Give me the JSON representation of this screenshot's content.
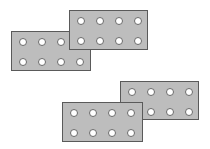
{
  "diagram": {
    "colors": {
      "background": "#ffffff",
      "brick_fill": "#bdbdbd",
      "brick_border": "#5a5a5a",
      "stud_fill": "#ffffff",
      "stud_border": "#6a6a6a"
    },
    "bricks": [
      {
        "id": "top-left",
        "x": 11,
        "y": 31,
        "w": 80,
        "h": 40,
        "rows": 2,
        "cols": 4,
        "z": 1
      },
      {
        "id": "top-right",
        "x": 69,
        "y": 10,
        "w": 79,
        "h": 40,
        "rows": 2,
        "cols": 4,
        "z": 2
      },
      {
        "id": "bottom-right",
        "x": 120,
        "y": 81,
        "w": 79,
        "h": 39,
        "rows": 2,
        "cols": 4,
        "z": 1
      },
      {
        "id": "bottom-left",
        "x": 62,
        "y": 102,
        "w": 81,
        "h": 40,
        "rows": 2,
        "cols": 4,
        "z": 2
      }
    ]
  }
}
